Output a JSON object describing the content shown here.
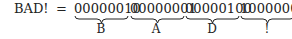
{
  "equation": {
    "lhs": "BAD!",
    "equals": "=",
    "bytes": [
      {
        "bits": "00000010",
        "char": "B"
      },
      {
        "bits": "00000001",
        "char": "A"
      },
      {
        "bits": "00000100",
        "char": "D"
      },
      {
        "bits": "10000001",
        "char": "!"
      }
    ]
  }
}
